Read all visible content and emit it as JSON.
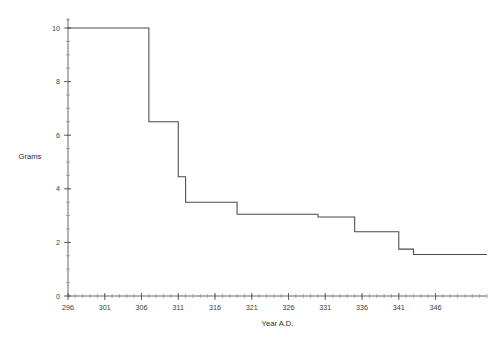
{
  "chart_data": {
    "type": "line",
    "subtype": "step-post",
    "title": "",
    "xlabel": "Year A.D.",
    "ylabel": "Grams",
    "xlim": [
      296,
      353
    ],
    "ylim": [
      0,
      10
    ],
    "grid": false,
    "legend": null,
    "x_ticks": [
      296,
      301,
      306,
      311,
      316,
      321,
      326,
      331,
      336,
      341,
      346
    ],
    "x_tick_labels": [
      "296",
      "301",
      "306",
      "311",
      "316",
      "321",
      "326",
      "331",
      "336",
      "341",
      "346"
    ],
    "x_minor_step": 1,
    "y_ticks": [
      0,
      2,
      4,
      6,
      8,
      10
    ],
    "y_tick_labels": [
      "0",
      "2",
      "4",
      "6",
      "8",
      "10"
    ],
    "y_minor_step": 0.5,
    "x": [
      296,
      307,
      311,
      312,
      319,
      330,
      335,
      341,
      343,
      353
    ],
    "values": [
      10.0,
      6.5,
      4.45,
      3.5,
      3.05,
      2.95,
      2.4,
      1.75,
      1.55,
      1.55
    ],
    "steps": [
      {
        "start": 296,
        "end": 307,
        "grams": 10.0
      },
      {
        "start": 307,
        "end": 311,
        "grams": 6.5
      },
      {
        "start": 311,
        "end": 312,
        "grams": 4.45
      },
      {
        "start": 312,
        "end": 319,
        "grams": 3.5
      },
      {
        "start": 319,
        "end": 330,
        "grams": 3.05
      },
      {
        "start": 330,
        "end": 335,
        "grams": 2.95
      },
      {
        "start": 335,
        "end": 341,
        "grams": 2.4
      },
      {
        "start": 341,
        "end": 343,
        "grams": 1.75
      },
      {
        "start": 343,
        "end": 353,
        "grams": 1.55
      }
    ],
    "line_color": "#4a4a4a",
    "axis_color": "#555555",
    "background": "#ffffff"
  }
}
